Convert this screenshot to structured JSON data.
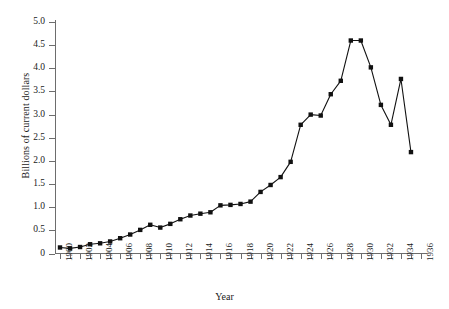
{
  "chart_data": {
    "type": "line",
    "title": "",
    "xlabel": "Year",
    "ylabel": "Billions of current dollars",
    "xlim": [
      1900,
      1936
    ],
    "ylim": [
      0,
      5.0
    ],
    "grid": false,
    "legend": "none",
    "marker": "square",
    "series_color": "#111111",
    "axis_color": "#6d6d6d",
    "x": [
      1900,
      1901,
      1902,
      1903,
      1904,
      1905,
      1906,
      1907,
      1908,
      1909,
      1910,
      1911,
      1912,
      1913,
      1914,
      1915,
      1916,
      1917,
      1918,
      1919,
      1920,
      1921,
      1922,
      1923,
      1924,
      1925,
      1926,
      1927,
      1928,
      1929,
      1930,
      1931,
      1932,
      1933,
      1934,
      1935
    ],
    "values": [
      0.13,
      0.11,
      0.14,
      0.2,
      0.22,
      0.26,
      0.33,
      0.41,
      0.51,
      0.62,
      0.56,
      0.64,
      0.74,
      0.82,
      0.86,
      0.89,
      1.04,
      1.05,
      1.07,
      1.12,
      1.33,
      1.48,
      1.65,
      1.98,
      2.78,
      3.0,
      2.98,
      3.44,
      3.73,
      4.6,
      4.6,
      4.02,
      3.21,
      2.78,
      3.77,
      2.19
    ],
    "ytick_labels": [
      "5.0",
      "4.5",
      "4.0",
      "3.5",
      "3.0",
      "2.5",
      "2.0",
      "1.5",
      "1.0",
      "0.5",
      "0"
    ],
    "ytick_values": [
      5.0,
      4.5,
      4.0,
      3.5,
      3.0,
      2.5,
      2.0,
      1.5,
      1.0,
      0.5,
      0
    ],
    "xtick_values": [
      1900,
      1901,
      1902,
      1903,
      1904,
      1905,
      1906,
      1907,
      1908,
      1909,
      1910,
      1911,
      1912,
      1913,
      1914,
      1915,
      1916,
      1917,
      1918,
      1919,
      1920,
      1921,
      1922,
      1923,
      1924,
      1925,
      1926,
      1927,
      1928,
      1929,
      1930,
      1931,
      1932,
      1933,
      1934,
      1935,
      1936
    ],
    "xtick_labels": [
      {
        "value": 1900,
        "label": "1900"
      },
      {
        "value": 1902,
        "label": "1902"
      },
      {
        "value": 1904,
        "label": "1904"
      },
      {
        "value": 1906,
        "label": "1906"
      },
      {
        "value": 1908,
        "label": "1908"
      },
      {
        "value": 1910,
        "label": "1910"
      },
      {
        "value": 1912,
        "label": "1912"
      },
      {
        "value": 1914,
        "label": "1914"
      },
      {
        "value": 1916,
        "label": "1916"
      },
      {
        "value": 1918,
        "label": "1918"
      },
      {
        "value": 1920,
        "label": "1920"
      },
      {
        "value": 1922,
        "label": "1922"
      },
      {
        "value": 1924,
        "label": "1924"
      },
      {
        "value": 1926,
        "label": "1926"
      },
      {
        "value": 1928,
        "label": "1928"
      },
      {
        "value": 1930,
        "label": "1930"
      },
      {
        "value": 1932,
        "label": "1932"
      },
      {
        "value": 1934,
        "label": "1934"
      },
      {
        "value": 1936,
        "label": "1936"
      }
    ]
  }
}
